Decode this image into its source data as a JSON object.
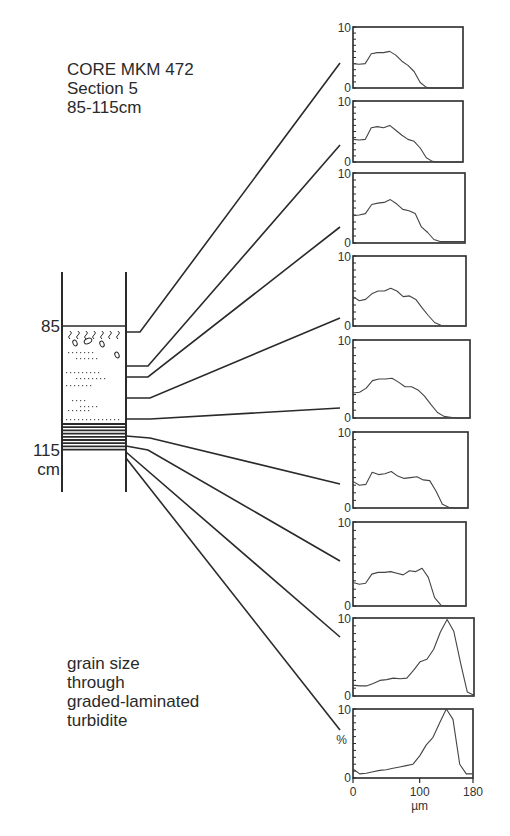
{
  "header": {
    "line1": "CORE MKM 472",
    "line2": "Section 5",
    "line3": "85-115cm"
  },
  "core": {
    "top_label": "85",
    "bottom_label": "115",
    "unit_label": "cm"
  },
  "caption": {
    "line1": "grain size",
    "line2": "through",
    "line3": "graded-laminated",
    "line4": "turbidite"
  },
  "axes": {
    "y_top_tick": "10",
    "y_bottom_tick": "0",
    "y_unit": "%",
    "x_ticks": [
      "0",
      "100",
      "180"
    ],
    "x_unit": "µm"
  },
  "colors": {
    "line": "#2a2a2a",
    "background": "#ffffff"
  },
  "chart_data": {
    "type": "line",
    "xlabel": "µm",
    "ylabel": "%",
    "xlim": [
      0,
      180
    ],
    "ylim": [
      0,
      10
    ],
    "x_ticks": [
      0,
      100,
      180
    ],
    "y_ticks": [
      0,
      10
    ],
    "grid": false,
    "x": [
      0,
      10,
      20,
      30,
      40,
      50,
      60,
      70,
      80,
      90,
      100,
      110,
      120,
      130,
      140,
      150,
      160,
      170,
      180
    ],
    "series": [
      {
        "name": "sample 1 (top)",
        "values": [
          4.0,
          3.9,
          4.0,
          5.6,
          5.8,
          5.8,
          6.0,
          5.4,
          4.4,
          3.7,
          2.7,
          0.9,
          0.1,
          0,
          0,
          0,
          0,
          0,
          0
        ]
      },
      {
        "name": "sample 2",
        "values": [
          3.7,
          3.6,
          3.7,
          5.6,
          5.8,
          5.6,
          6.0,
          5.2,
          4.4,
          3.7,
          3.4,
          2.3,
          0.7,
          0.1,
          0,
          0,
          0,
          0,
          0
        ]
      },
      {
        "name": "sample 3",
        "values": [
          3.9,
          4.0,
          4.2,
          5.5,
          5.7,
          5.8,
          6.2,
          5.6,
          4.8,
          4.6,
          4.2,
          2.3,
          1.5,
          0.5,
          0.2,
          0.2,
          0.2,
          0.2,
          0.2
        ]
      },
      {
        "name": "sample 4",
        "values": [
          4.2,
          3.6,
          3.8,
          4.6,
          5.0,
          5.0,
          5.4,
          5.0,
          4.2,
          4.3,
          3.8,
          2.6,
          1.5,
          0.5,
          0.1,
          0,
          0,
          0,
          0
        ]
      },
      {
        "name": "sample 5",
        "values": [
          3.2,
          3.3,
          3.8,
          4.8,
          5.0,
          5.0,
          5.1,
          4.6,
          4.0,
          4.0,
          3.6,
          2.8,
          1.7,
          0.7,
          0.2,
          0.1,
          0,
          0,
          0
        ]
      },
      {
        "name": "sample 6",
        "values": [
          3.5,
          3.0,
          3.1,
          4.7,
          4.4,
          4.5,
          4.8,
          4.2,
          3.9,
          4.0,
          4.1,
          3.7,
          3.6,
          2.2,
          0.5,
          0.1,
          0,
          0,
          0
        ]
      },
      {
        "name": "sample 7",
        "values": [
          2.8,
          2.6,
          2.7,
          3.8,
          4.0,
          4.0,
          4.1,
          3.9,
          3.7,
          4.2,
          4.1,
          4.5,
          3.4,
          1.0,
          0.1,
          0,
          0,
          0,
          0
        ]
      },
      {
        "name": "sample 8",
        "values": [
          1.4,
          1.3,
          1.3,
          1.6,
          2.0,
          2.1,
          2.3,
          2.2,
          2.3,
          3.3,
          4.4,
          4.7,
          6.0,
          8.2,
          9.8,
          8.3,
          4.2,
          0.5,
          0.1
        ]
      },
      {
        "name": "sample 9 (bottom)",
        "values": [
          1.3,
          0.6,
          0.7,
          0.9,
          1.1,
          1.2,
          1.4,
          1.6,
          1.8,
          2.0,
          3.2,
          4.8,
          5.9,
          8.0,
          10.0,
          8.5,
          2.0,
          0.6,
          0.6
        ]
      }
    ],
    "annotations": [
      "CORE MKM 472",
      "Section 5",
      "85-115cm",
      "85",
      "115 cm",
      "grain size through graded-laminated turbidite"
    ]
  }
}
